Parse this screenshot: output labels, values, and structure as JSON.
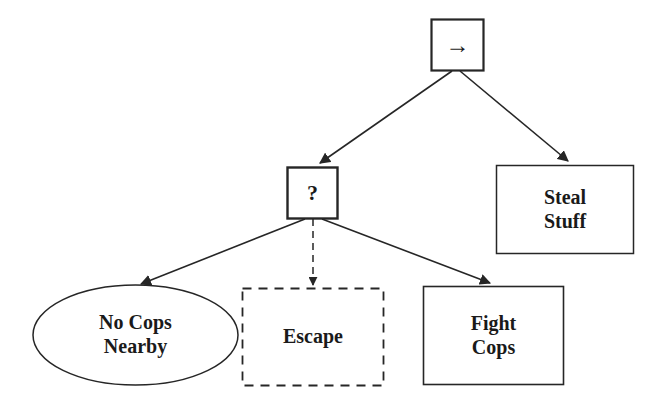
{
  "diagram": {
    "type": "decision-tree",
    "background_color": "#ffffff",
    "stroke_color": "#262626",
    "text_color": "#1a1a1a",
    "nodes": [
      {
        "id": "root",
        "label": "→",
        "icon": "right-arrow-icon",
        "shape": "square",
        "border": "solid",
        "x": 431,
        "y": 19,
        "width": 53,
        "height": 52
      },
      {
        "id": "question",
        "label": "?",
        "shape": "square",
        "border": "solid",
        "x": 287,
        "y": 167,
        "width": 51,
        "height": 52
      },
      {
        "id": "steal-stuff",
        "label": "Steal\nStuff",
        "shape": "rectangle",
        "border": "solid",
        "x": 496,
        "y": 165,
        "width": 138,
        "height": 89
      },
      {
        "id": "no-cops-nearby",
        "label": "No Cops\nNearby",
        "shape": "ellipse",
        "border": "solid",
        "x": 33,
        "y": 285,
        "width": 205,
        "height": 100
      },
      {
        "id": "escape",
        "label": "Escape",
        "shape": "rectangle",
        "border": "dashed",
        "x": 242,
        "y": 288,
        "width": 142,
        "height": 98
      },
      {
        "id": "fight-cops",
        "label": "Fight\nCops",
        "shape": "rectangle",
        "border": "solid",
        "x": 423,
        "y": 286,
        "width": 141,
        "height": 99
      }
    ],
    "edges": [
      {
        "id": "root-to-question",
        "from": "root",
        "to": "question",
        "style": "solid",
        "arrowhead": true
      },
      {
        "id": "root-to-steal",
        "from": "root",
        "to": "steal-stuff",
        "style": "solid",
        "arrowhead": true
      },
      {
        "id": "question-to-nocops",
        "from": "question",
        "to": "no-cops-nearby",
        "style": "solid",
        "arrowhead": true
      },
      {
        "id": "question-to-escape",
        "from": "question",
        "to": "escape",
        "style": "dashed",
        "arrowhead": true
      },
      {
        "id": "question-to-fight",
        "from": "question",
        "to": "fight-cops",
        "style": "solid",
        "arrowhead": true
      }
    ]
  }
}
